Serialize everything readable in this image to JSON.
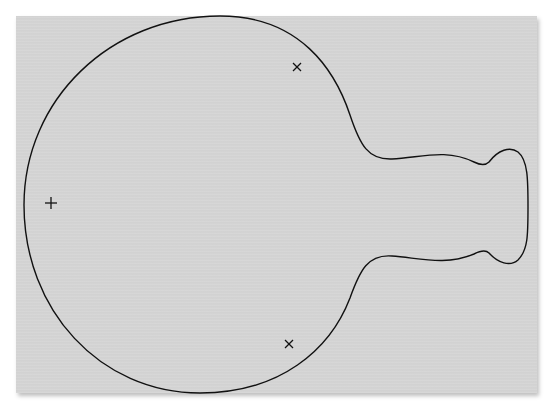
{
  "figure": {
    "background_color": "#d6d6d6",
    "page_color": "#ffffff",
    "line_color": "#111111",
    "contour": {
      "description": "closed contour: large circle with narrow neck leading to a double-lobed bulb on the right"
    },
    "markers": [
      {
        "type": "plus",
        "symbol": "+",
        "x": 51,
        "y": 203
      },
      {
        "type": "cross",
        "symbol": "×",
        "x": 297,
        "y": 67
      },
      {
        "type": "cross",
        "symbol": "×",
        "x": 289,
        "y": 344
      }
    ]
  }
}
